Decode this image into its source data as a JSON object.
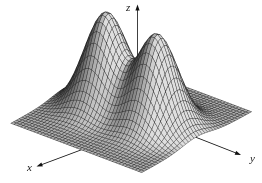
{
  "chart_data": {
    "type": "surface",
    "subtype": "3d-wireframe-mesh",
    "title": "",
    "axis_labels": {
      "x": "x",
      "y": "y",
      "z": "z"
    },
    "surface": {
      "domain_x": [
        -1,
        1
      ],
      "domain_y": [
        -1,
        1
      ],
      "grid": [
        40,
        40
      ],
      "z_range": [
        0,
        1.01
      ],
      "peaks": [
        {
          "x": 0,
          "y": -0.39,
          "amplitude": 1.0,
          "width": 0.363
        },
        {
          "x": 0,
          "y": 0.39,
          "amplitude": 0.97,
          "width": 0.363
        }
      ]
    },
    "style": {
      "background": "#ffffff",
      "mesh_line_color": "#222222",
      "fill_gray_min": "#4a4a4a",
      "fill_gray_max": "#dedede",
      "axis_color": "#111111"
    },
    "legend": null,
    "grid_on": true
  }
}
